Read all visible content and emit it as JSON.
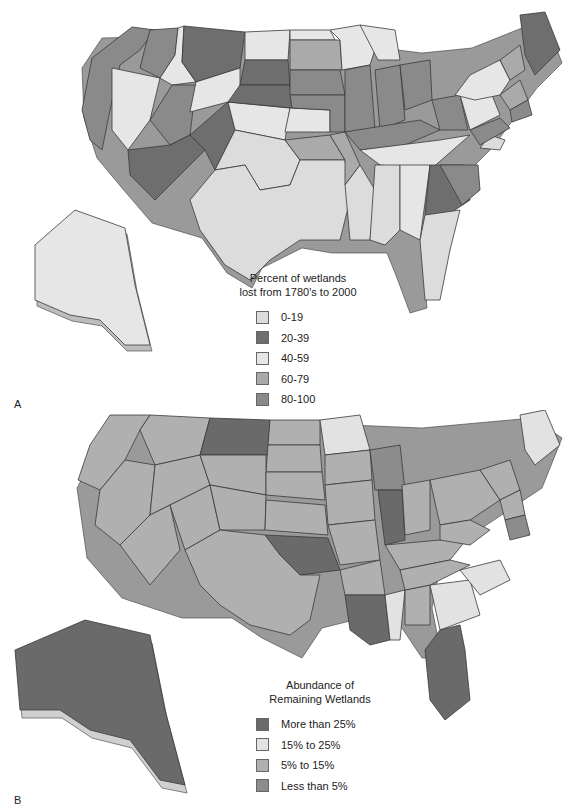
{
  "panel_a": {
    "letter": "A",
    "legend": {
      "title_line1": "Percent of wetlands",
      "title_line2": "lost from 1780's to 2000",
      "items": [
        {
          "label": "0-19",
          "color": "#dcdcdc"
        },
        {
          "label": "20-39",
          "color": "#6e6e6e"
        },
        {
          "label": "40-59",
          "color": "#e6e6e6"
        },
        {
          "label": "60-79",
          "color": "#aaaaaa"
        },
        {
          "label": "80-100",
          "color": "#8a8a8a"
        }
      ]
    }
  },
  "panel_b": {
    "letter": "B",
    "legend": {
      "title_line1": "Abundance of",
      "title_line2": "Remaining Wetlands",
      "items": [
        {
          "label": "More than 25%",
          "color": "#6a6a6a"
        },
        {
          "label": "15% to 25%",
          "color": "#e2e2e2"
        },
        {
          "label": "5% to 15%",
          "color": "#b0b0b0"
        },
        {
          "label": "Less than 5%",
          "color": "#8c8c8c"
        }
      ]
    }
  }
}
